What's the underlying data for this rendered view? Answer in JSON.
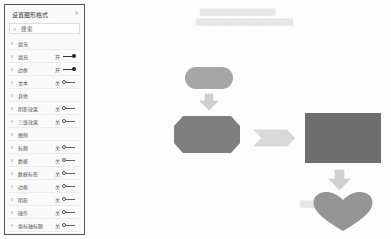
{
  "panel": {
    "title": "设置图形格式",
    "close": "×",
    "search_icon": "⌕",
    "search_placeholder": "搜索",
    "rows": [
      {
        "label": "填充",
        "type": "section"
      },
      {
        "label": "填充",
        "state": "开",
        "on": true
      },
      {
        "label": "边框",
        "state": "开",
        "on": true
      },
      {
        "label": "文本",
        "state": "关",
        "on": false
      },
      {
        "label": "其他",
        "type": "section"
      },
      {
        "label": "阴影效果",
        "state": "关",
        "on": false
      },
      {
        "label": "三维效果",
        "state": "关",
        "on": false
      },
      {
        "label": "图例",
        "type": "section"
      },
      {
        "label": "标题",
        "state": "关",
        "on": false
      },
      {
        "label": "数据",
        "state": "关",
        "on": false
      },
      {
        "label": "数据标签",
        "state": "关",
        "on": false
      },
      {
        "label": "边框",
        "state": "关",
        "on": false
      },
      {
        "label": "阴影",
        "state": "关",
        "on": false
      },
      {
        "label": "操作",
        "state": "关",
        "on": false
      },
      {
        "label": "坐标轴标题",
        "state": "关",
        "on": false
      }
    ]
  },
  "canvas": {
    "shapes": [
      {
        "name": "rounded-rectangle",
        "color": "#a6a6a6"
      },
      {
        "name": "down-arrow",
        "color": "#d0d0d0"
      },
      {
        "name": "octagon",
        "color": "#7f7f7f"
      },
      {
        "name": "chevron-arrow",
        "color": "#d9d9d9"
      },
      {
        "name": "rectangle",
        "color": "#6e6e6e"
      },
      {
        "name": "down-arrow",
        "color": "#d0d0d0"
      },
      {
        "name": "heart",
        "color": "#959595"
      }
    ]
  }
}
